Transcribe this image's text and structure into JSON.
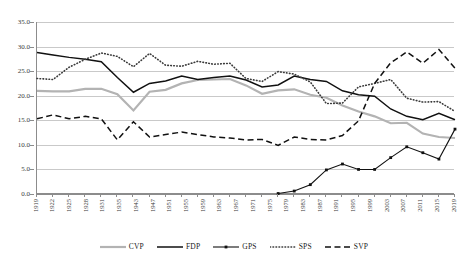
{
  "chart_data": {
    "type": "line",
    "title": "",
    "subtitle": "",
    "xlabel": "",
    "ylabel": "",
    "ylim": [
      0.0,
      35.0
    ],
    "grid": true,
    "legend_position": "bottom",
    "y_ticks": [
      "0.0",
      "5.0",
      "10.0",
      "15.0",
      "20.0",
      "25.0",
      "30.0",
      "35.0"
    ],
    "y_tick_values": [
      0.0,
      5.0,
      10.0,
      15.0,
      20.0,
      25.0,
      30.0,
      35.0
    ],
    "categories": [
      "1919",
      "1922",
      "1925",
      "1928",
      "1931",
      "1935",
      "1939",
      "1943",
      "1947",
      "1951",
      "1955",
      "1959",
      "1963",
      "1967",
      "1971",
      "1975",
      "1979",
      "1983",
      "1987",
      "1991",
      "1995",
      "1999",
      "2003",
      "2007",
      "2011",
      "2015",
      "2019"
    ],
    "x_tick_labels": [
      "1919",
      "1922",
      "1925",
      "1928",
      "1931",
      "1935",
      "1943",
      "1947",
      "1951",
      "1955",
      "1959",
      "1963",
      "1967",
      "1971",
      "1975",
      "1979",
      "1983",
      "1987",
      "1991",
      "1995",
      "1999",
      "2003",
      "2007",
      "2011",
      "2015",
      "2019"
    ],
    "series": [
      {
        "name": "CVP",
        "color": "#b3b3b3",
        "style": "solid-thick",
        "values": [
          21.0,
          20.9,
          20.9,
          21.4,
          21.4,
          20.3,
          17.0,
          20.8,
          21.2,
          22.5,
          23.2,
          23.3,
          23.4,
          22.1,
          20.4,
          21.1,
          21.3,
          20.2,
          19.6,
          18.0,
          16.8,
          15.8,
          14.4,
          14.5,
          12.3,
          11.6,
          11.4
        ]
      },
      {
        "name": "FDP",
        "color": "#111111",
        "style": "solid",
        "values": [
          28.8,
          28.3,
          27.8,
          27.4,
          26.9,
          23.7,
          20.7,
          22.5,
          23.0,
          24.0,
          23.3,
          23.7,
          24.0,
          23.2,
          21.8,
          22.2,
          24.0,
          23.3,
          22.9,
          21.0,
          20.2,
          19.9,
          17.3,
          15.8,
          15.1,
          16.4,
          15.1
        ]
      },
      {
        "name": "GPS",
        "color": "#111111",
        "style": "solid-markers",
        "values": [
          null,
          null,
          null,
          null,
          null,
          null,
          null,
          null,
          null,
          null,
          null,
          null,
          null,
          null,
          null,
          0.1,
          0.6,
          1.9,
          4.9,
          6.1,
          5.0,
          5.0,
          7.4,
          9.6,
          8.4,
          7.1,
          13.2
        ]
      },
      {
        "name": "SPS",
        "color": "#3a3a3a",
        "style": "dotted",
        "values": [
          23.5,
          23.3,
          25.8,
          27.4,
          28.7,
          28.0,
          25.9,
          28.6,
          26.2,
          26.0,
          27.0,
          26.4,
          26.6,
          23.5,
          22.9,
          24.9,
          24.4,
          22.8,
          18.4,
          18.5,
          21.8,
          22.5,
          23.3,
          19.5,
          18.7,
          18.8,
          16.8
        ]
      },
      {
        "name": "SVP",
        "color": "#111111",
        "style": "dashed",
        "values": [
          15.3,
          16.1,
          15.3,
          15.8,
          15.3,
          11.0,
          14.7,
          11.6,
          12.1,
          12.6,
          12.1,
          11.6,
          11.4,
          11.0,
          11.1,
          9.9,
          11.6,
          11.1,
          11.0,
          11.9,
          14.9,
          22.5,
          26.7,
          28.9,
          26.6,
          29.4,
          25.6
        ]
      }
    ]
  },
  "legend": {
    "items": [
      {
        "label": "CVP",
        "swatch": "line-solid-gray"
      },
      {
        "label": "FDP",
        "swatch": "line-solid-black"
      },
      {
        "label": "GPS",
        "swatch": "line-marker-black"
      },
      {
        "label": "SPS",
        "swatch": "line-dotted-black"
      },
      {
        "label": "SVP",
        "swatch": "line-dashed-black"
      }
    ]
  }
}
